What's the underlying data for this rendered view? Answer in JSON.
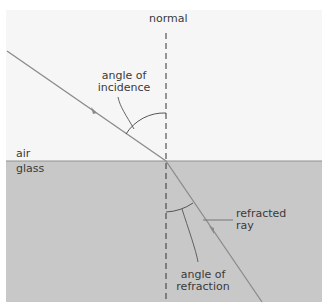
{
  "labels": {
    "normal": "normal",
    "incidence_line1": "angle of",
    "incidence_line2": "incidence",
    "air": "air",
    "glass": "glass",
    "refracted_line1": "refracted",
    "refracted_line2": "ray",
    "refraction_line1": "angle of",
    "refraction_line2": "refraction"
  },
  "colors": {
    "air_bg": "#f6f6f6",
    "glass_bg": "#c8c8c8",
    "ray": "#8a8a8a",
    "normal_line": "#333333",
    "text": "#3a3a3a"
  }
}
